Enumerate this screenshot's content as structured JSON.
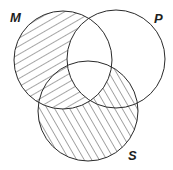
{
  "diagram": {
    "type": "venn",
    "sets": [
      {
        "id": "M",
        "label": "M"
      },
      {
        "id": "P",
        "label": "P"
      },
      {
        "id": "S",
        "label": "S"
      }
    ],
    "shaded_regions": [
      {
        "region": "M minus P",
        "hatch_direction": "forward-slash"
      },
      {
        "region": "S minus M",
        "hatch_direction": "back-slash"
      }
    ],
    "unshaded_regions": [
      "M and P (outside S)",
      "M and P and S",
      "P only"
    ],
    "colors": {
      "stroke": "#2a2a2a",
      "background": "#ffffff"
    }
  }
}
